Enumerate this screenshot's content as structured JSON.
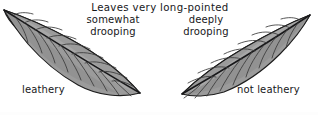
{
  "figure": {
    "heading": "Leaves very long-pointed",
    "background_color": "#ffffff",
    "text_color": "#17171a",
    "leaf_fill_color": "#9b9b9b",
    "leaf_outline_color": "#1d1d1d"
  },
  "left_specimen": {
    "caption_line1": "somewhat",
    "caption_line2": "drooping",
    "texture_label": "leathery",
    "icon_name": "leaf-illustration"
  },
  "right_specimen": {
    "caption_line1": "deeply",
    "caption_line2": "drooping",
    "texture_label": "not leathery",
    "icon_name": "leaf-illustration"
  }
}
